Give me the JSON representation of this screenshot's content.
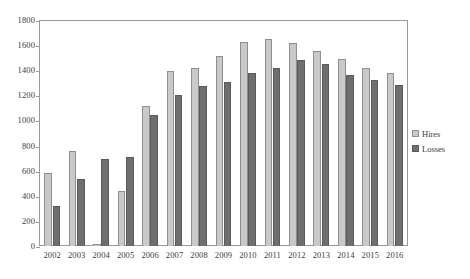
{
  "chart_data": {
    "type": "bar",
    "title": "",
    "subtitle": "",
    "xlabel": "",
    "ylabel": "",
    "ylim": [
      0,
      1800
    ],
    "ytick_step": 200,
    "yticks": [
      0,
      200,
      400,
      600,
      800,
      1000,
      1200,
      1400,
      1600,
      1800
    ],
    "ytick_labels": [
      "0",
      "200",
      "400",
      "600",
      "800",
      "1000",
      "1200",
      "1400",
      "1600",
      "1800"
    ],
    "grid": false,
    "legend_position": "right",
    "categories": [
      "2002",
      "2003",
      "2004",
      "2005",
      "2006",
      "2007",
      "2008",
      "2009",
      "2010",
      "2011",
      "2012",
      "2013",
      "2014",
      "2015",
      "2016"
    ],
    "series": [
      {
        "name": "Hires",
        "color": "#c9c9c9",
        "values": [
          580,
          755,
          15,
          440,
          1115,
          1390,
          1420,
          1515,
          1625,
          1645,
          1620,
          1555,
          1490,
          1420,
          1375
        ]
      },
      {
        "name": "Losses",
        "color": "#6f6f6f",
        "values": [
          320,
          535,
          695,
          705,
          1040,
          1200,
          1275,
          1310,
          1375,
          1415,
          1480,
          1450,
          1360,
          1320,
          1280
        ]
      }
    ],
    "annotations": []
  },
  "legend": {
    "items": [
      {
        "label": "Hires",
        "swatch": "hires-swatch"
      },
      {
        "label": "Losses",
        "swatch": "losses-swatch"
      }
    ]
  }
}
